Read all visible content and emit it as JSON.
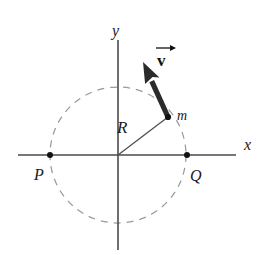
{
  "figure": {
    "kind": "physics-diagram",
    "background_color": "#ffffff"
  },
  "axes": {
    "x_label": "x",
    "y_label": "y",
    "axis_color": "#4a4a4a",
    "origin": {
      "x": 118,
      "y": 155
    },
    "x_axis": {
      "x_start": 18,
      "x_end": 236,
      "y": 155
    },
    "y_axis": {
      "x": 118,
      "y_start": 40,
      "y_end": 250
    }
  },
  "orbit": {
    "name": "dashed-circular-path",
    "center": {
      "x": 118,
      "y": 155
    },
    "radius": 68,
    "stroke_color": "#9a9a9a",
    "dash_pattern": "7 6"
  },
  "radius_vector": {
    "label": "R",
    "label_position": {
      "x": 124,
      "y": 126
    },
    "from": {
      "x": 118,
      "y": 155
    },
    "to": {
      "x": 168,
      "y": 117
    }
  },
  "particle": {
    "label": "m",
    "label_position": {
      "x": 178,
      "y": 117
    },
    "dot": {
      "x": 168,
      "y": 117,
      "r": 3.1
    }
  },
  "velocity_vector": {
    "label": "v",
    "label_has_arrow_accent": true,
    "label_position": {
      "x": 161,
      "y": 56
    },
    "tail": {
      "x": 168,
      "y": 117
    },
    "tip": {
      "x": 143,
      "y": 62
    },
    "color": "#2b2b2b"
  },
  "points": [
    {
      "label": "P",
      "dot": {
        "x": 50,
        "y": 155,
        "r": 3.0
      },
      "label_position": {
        "x": 40,
        "y": 180
      }
    },
    {
      "label": "Q",
      "dot": {
        "x": 187,
        "y": 155,
        "r": 3.0
      },
      "label_position": {
        "x": 191,
        "y": 182
      }
    }
  ],
  "chart_data": {
    "type": "scatter",
    "title": "",
    "xlabel": "x",
    "ylabel": "y",
    "annotations": [
      "R",
      "m",
      "v",
      "P",
      "Q"
    ],
    "circle_radius_px": 68,
    "particle_angle_deg": 37
  }
}
